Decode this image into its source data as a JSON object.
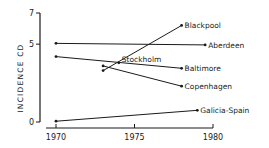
{
  "chart_data": {
    "type": "line",
    "title": "",
    "xlabel": "",
    "ylabel": "INCIDENCE CD",
    "xlim": [
      1970,
      1980
    ],
    "ylim": [
      0,
      7
    ],
    "xticks": [
      1970,
      1975,
      1980
    ],
    "xtick_labels": [
      "1970",
      "1975",
      "1980"
    ],
    "yticks": [
      0,
      5,
      7
    ],
    "ytick_labels": [
      "0",
      "5",
      "7"
    ],
    "grid": false,
    "legend": "inline labels at line ends",
    "series": [
      {
        "name": "Blackpool",
        "x": [
          1973,
          1978
        ],
        "y": [
          3.3,
          6.2
        ]
      },
      {
        "name": "Aberdeen",
        "x": [
          1970,
          1979.5
        ],
        "y": [
          5.05,
          4.95
        ]
      },
      {
        "name": "Stockholm",
        "x": [
          1974
        ],
        "y": [
          3.8
        ]
      },
      {
        "name": "Baltimore",
        "x": [
          1970,
          1978
        ],
        "y": [
          4.2,
          3.45
        ]
      },
      {
        "name": "Copenhagen",
        "x": [
          1973,
          1978
        ],
        "y": [
          3.6,
          2.3
        ]
      },
      {
        "name": "Galicia-Spain",
        "x": [
          1970,
          1979
        ],
        "y": [
          0.05,
          0.75
        ]
      }
    ]
  }
}
